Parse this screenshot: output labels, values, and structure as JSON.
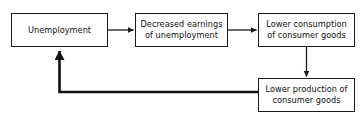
{
  "diagram": {
    "type": "flowchart-cycle",
    "background_color": "#ffffff",
    "stroke_color": "#1a1a1a",
    "text_color": "#111111",
    "nodes": [
      {
        "id": "unemployment",
        "label": "Unemployment",
        "x": 11,
        "y": 13,
        "width": 97,
        "height": 34
      },
      {
        "id": "decreased-earnings",
        "label": "Decreased earnings\nof unemployment",
        "x": 135,
        "y": 13,
        "width": 93,
        "height": 34
      },
      {
        "id": "lower-consumption",
        "label": "Lower consumption\nof consumer goods",
        "x": 258,
        "y": 13,
        "width": 97,
        "height": 34
      },
      {
        "id": "lower-production",
        "label": "Lower production of\nconsumer goods",
        "x": 258,
        "y": 78,
        "width": 97,
        "height": 34
      }
    ],
    "edges": [
      {
        "id": "unemployment-to-decreased-earnings",
        "from": "unemployment",
        "to": "decreased-earnings",
        "direction": "right",
        "weight": "thin"
      },
      {
        "id": "decreased-earnings-to-lower-consumption",
        "from": "decreased-earnings",
        "to": "lower-consumption",
        "direction": "right",
        "weight": "thin"
      },
      {
        "id": "lower-consumption-to-lower-production",
        "from": "lower-consumption",
        "to": "lower-production",
        "direction": "down",
        "weight": "thin"
      },
      {
        "id": "lower-production-to-unemployment",
        "from": "lower-production",
        "to": "unemployment",
        "direction": "left-up",
        "weight": "thick"
      }
    ]
  }
}
